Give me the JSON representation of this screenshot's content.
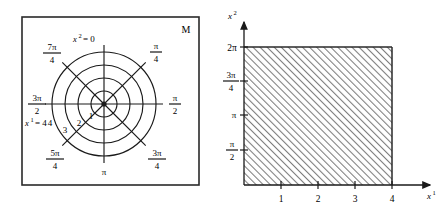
{
  "figure": {
    "panels": [
      {
        "id": "polar-manifold",
        "corner_label": "M",
        "type": "polar-grid",
        "radial_labels": [
          "1",
          "2",
          "3",
          "4"
        ],
        "radial_axis_label": "x¹ = 4",
        "angular_origin_label": "x² = 0",
        "angle_labels": [
          {
            "num": "π",
            "den": "4",
            "angle_deg": 45
          },
          {
            "num": "π",
            "den": "2",
            "angle_deg": 90
          },
          {
            "num": "3π",
            "den": "4",
            "angle_deg": 135
          },
          {
            "whole": "π",
            "angle_deg": 180
          },
          {
            "num": "5π",
            "den": "4",
            "angle_deg": 225
          },
          {
            "num": "3π",
            "den": "2",
            "angle_deg": 270
          },
          {
            "num": "7π",
            "den": "4",
            "angle_deg": 315
          }
        ],
        "ring_count": 4,
        "spoke_count": 8
      },
      {
        "id": "parameter-domain",
        "type": "shaded-rectangle",
        "xlabel": "x¹",
        "ylabel": "x²",
        "x_ticks": [
          "1",
          "2",
          "3",
          "4"
        ],
        "y_ticks": [
          {
            "num": "π",
            "den": "2"
          },
          {
            "whole": "π"
          },
          {
            "num": "3π",
            "den": "4"
          },
          {
            "whole": "2π"
          }
        ],
        "region_x_range": [
          0,
          4
        ],
        "region_y_top_label": "2π",
        "hatch_fill": "#9a9a9a",
        "hatch_direction": "up-right"
      }
    ],
    "colors": {
      "ink": "#1a1a1a",
      "hatch": "#8d8d8d",
      "border": "#2a2a2a"
    }
  }
}
